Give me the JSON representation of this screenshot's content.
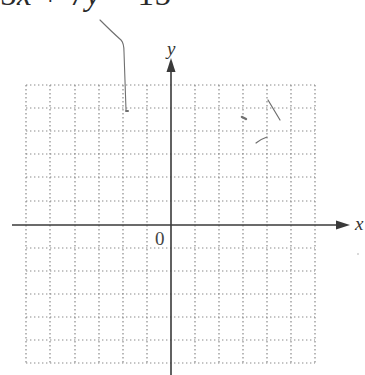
{
  "equation": {
    "parts": [
      "5",
      "x",
      " + 7",
      "y",
      " = 15"
    ],
    "text": "5x + 7y = 15"
  },
  "graph": {
    "x_axis_label": "x",
    "y_axis_label": "y",
    "origin_label": "0",
    "grid": {
      "columns_left": 6,
      "columns_right": 6,
      "rows_above": 6,
      "rows_below": 6,
      "style": "dotted"
    }
  },
  "colors": {
    "grid": "#8a8a8a",
    "axis": "#3a3a3a",
    "text": "#2a2a2a",
    "pencil": "#6f6f6f"
  }
}
